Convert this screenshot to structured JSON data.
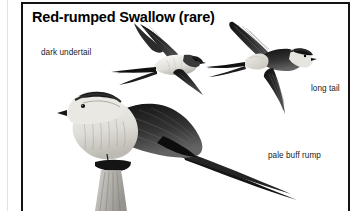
{
  "plate": {
    "title": "Red-rumped Swallow (rare)",
    "border_color": "#131313",
    "background_color": "#ffffff",
    "gutter_rule_color": "#e2e2e2"
  },
  "callouts": [
    {
      "id": "dark-undertail",
      "text": "dark undertail"
    },
    {
      "id": "long-tail",
      "text": "long tail"
    },
    {
      "id": "pale-buff-rump",
      "text": "pale buff rump"
    }
  ],
  "illustrations": [
    {
      "id": "swallow-in-flight-underside",
      "description": "swallow in flight viewed from below, pale underparts, deeply forked tail streamers"
    },
    {
      "id": "swallow-in-flight-upperside",
      "description": "swallow in flight viewed from above, dark wings and mantle, pale buff rump band, long outer tail streamers"
    },
    {
      "id": "swallow-perched",
      "description": "swallow perched on a branch, pale streaked underparts, dark glossy mantle and wings, long tail"
    }
  ],
  "palette": {
    "ink": "#000000",
    "text": "#1b1b1b",
    "plumage_dark": "#1d1d1d",
    "plumage_mid": "#5a5a5a",
    "plumage_light": "#c9c7c2",
    "plumage_pale": "#eeece7"
  }
}
